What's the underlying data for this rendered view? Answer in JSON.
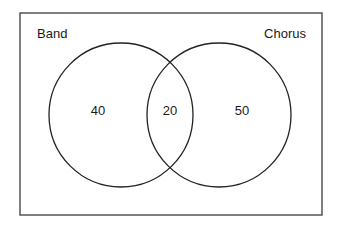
{
  "diagram": {
    "type": "venn",
    "sets": [
      {
        "name": "Band",
        "only_count": "40"
      },
      {
        "name": "Chorus",
        "only_count": "50"
      }
    ],
    "intersection_count": "20",
    "colors": {
      "stroke": "#222222",
      "frame": "#555555",
      "background": "#ffffff"
    }
  }
}
